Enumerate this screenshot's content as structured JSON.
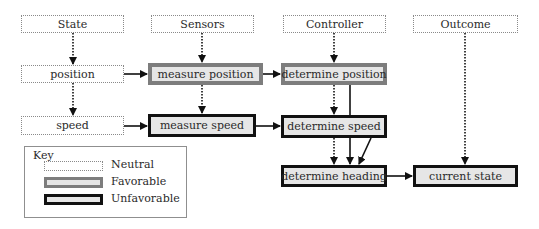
{
  "diagram": {
    "columns": [
      {
        "id": "state",
        "label": "State"
      },
      {
        "id": "sensors",
        "label": "Sensors"
      },
      {
        "id": "controller",
        "label": "Controller"
      },
      {
        "id": "outcome",
        "label": "Outcome"
      }
    ],
    "nodes": {
      "position": {
        "label": "position",
        "style": "neutral"
      },
      "speed": {
        "label": "speed",
        "style": "neutral"
      },
      "measure_position": {
        "label": "measure position",
        "style": "favorable"
      },
      "measure_speed": {
        "label": "measure speed",
        "style": "unfavorable"
      },
      "determine_position": {
        "label": "determine position",
        "style": "favorable"
      },
      "determine_speed": {
        "label": "determine speed",
        "style": "unfavorable"
      },
      "determine_heading": {
        "label": "determine heading",
        "style": "unfavorable"
      },
      "current_state": {
        "label": "current state",
        "style": "unfavorable"
      }
    },
    "edges": [
      {
        "from": "State",
        "to": "position",
        "type": "dotted"
      },
      {
        "from": "position",
        "to": "speed",
        "type": "dotted"
      },
      {
        "from": "Sensors",
        "to": "measure position",
        "type": "dotted"
      },
      {
        "from": "measure position",
        "to": "measure speed",
        "type": "dotted"
      },
      {
        "from": "Controller",
        "to": "determine position",
        "type": "dotted"
      },
      {
        "from": "determine position",
        "to": "determine speed",
        "type": "dotted"
      },
      {
        "from": "determine position",
        "to": "determine heading",
        "type": "solid"
      },
      {
        "from": "determine speed",
        "to": "determine heading",
        "type": "dotted"
      },
      {
        "from": "determine speed",
        "to": "determine heading",
        "type": "solid"
      },
      {
        "from": "Outcome",
        "to": "current state",
        "type": "dotted"
      },
      {
        "from": "position",
        "to": "measure position",
        "type": "solid"
      },
      {
        "from": "measure position",
        "to": "determine position",
        "type": "solid"
      },
      {
        "from": "speed",
        "to": "measure speed",
        "type": "solid"
      },
      {
        "from": "measure speed",
        "to": "determine speed",
        "type": "solid"
      },
      {
        "from": "determine heading",
        "to": "current state",
        "type": "solid"
      }
    ]
  },
  "key": {
    "title": "Key",
    "items": [
      {
        "label": "Neutral",
        "style": "neutral"
      },
      {
        "label": "Favorable",
        "style": "favorable"
      },
      {
        "label": "Unfavorable",
        "style": "unfavorable"
      }
    ]
  },
  "colors": {
    "favorable_border": "#7d7d7d",
    "unfavorable_border": "#111111",
    "fill": "#e6e6e6",
    "neutral_border": "#8a8a8a"
  }
}
